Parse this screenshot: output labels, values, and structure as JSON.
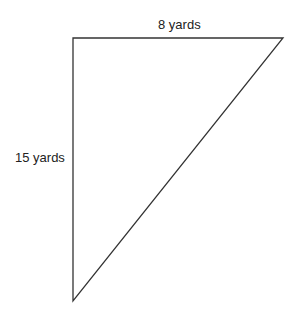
{
  "diagram": {
    "type": "right-triangle",
    "vertices": {
      "top_left": [
        73,
        38
      ],
      "top_right": [
        283,
        38
      ],
      "bottom": [
        73,
        301
      ]
    },
    "labels": {
      "top_side": "8 yards",
      "left_side": "15 yards"
    },
    "stroke_color": "#333333"
  }
}
